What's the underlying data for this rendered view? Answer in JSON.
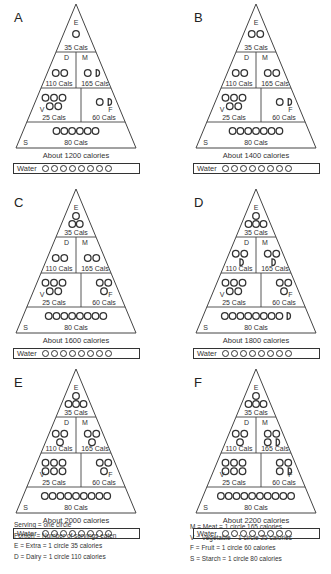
{
  "labels": {
    "extra": "E",
    "dairy": "D",
    "meat": "M",
    "vegetable": "V",
    "fruit": "F",
    "starch": "S",
    "extra_cals": "35 Cals",
    "dairy_cals": "110 Cals",
    "meat_cals": "165 Cals",
    "veg_cals": "25 Cals",
    "fruit_cals": "60 Cals",
    "starch_cals": "80 Cals",
    "water": "Water"
  },
  "panels": [
    {
      "letter": "A",
      "total": "About 1200 calories",
      "servings": {
        "extra": 1,
        "dairy": 2,
        "meat": 1.5,
        "vegetable": 5,
        "fruit": 1.5,
        "starch": 6
      },
      "water": 8
    },
    {
      "letter": "B",
      "total": "About 1400 calories",
      "servings": {
        "extra": 2,
        "dairy": 2,
        "meat": 2,
        "vegetable": 5,
        "fruit": 1.5,
        "starch": 7
      },
      "water": 8
    },
    {
      "letter": "C",
      "total": "About 1600 calories",
      "servings": {
        "extra": 3,
        "dairy": 2,
        "meat": 2,
        "vegetable": 5,
        "fruit": 3,
        "starch": 8
      },
      "water": 8
    },
    {
      "letter": "D",
      "total": "About 1800 calories",
      "servings": {
        "extra": 4,
        "dairy": 2.5,
        "meat": 2.5,
        "vegetable": 5,
        "fruit": 3,
        "starch": 8.5
      },
      "water": 8
    },
    {
      "letter": "E",
      "total": "About 2000 calories",
      "servings": {
        "extra": 4,
        "dairy": 3,
        "meat": 3,
        "vegetable": 6,
        "fruit": 3,
        "starch": 9
      },
      "water": 8
    },
    {
      "letter": "F",
      "total": "About 2200 calories",
      "servings": {
        "extra": 4,
        "dairy": 3,
        "meat": 3.5,
        "vegetable": 6,
        "fruit": 3.5,
        "starch": 10
      },
      "water": 8
    }
  ],
  "legend_left": [
    "Serving = one circle",
    "Portion = Number of servings eaten",
    "E = Extra = 1 circle 35 calories",
    "D = Dairy = 1 circle 110 calories"
  ],
  "legend_right": [
    "M = Meat = 1 circle 165 calories",
    "V = Vegetable = 1 circle 25 calories",
    "F = Fruit = 1 circle 60 calories",
    "S = Starch = 1 circle 80 calories"
  ]
}
